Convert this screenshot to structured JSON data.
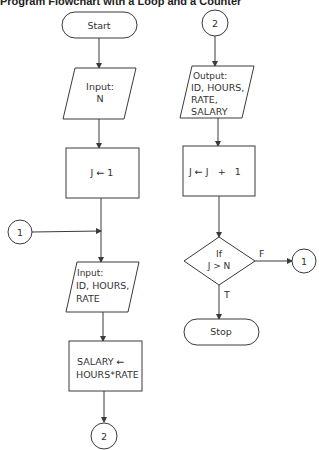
{
  "title": "Program Flowchart with a Loop and a Counter",
  "nodes": {
    "start": {
      "type": "terminal",
      "label": "Start"
    },
    "input_n": {
      "type": "input-output",
      "lines": [
        "Input:",
        "N"
      ]
    },
    "init_counter": {
      "type": "process",
      "lines": [
        "J ← 1"
      ]
    },
    "connector_1_left": {
      "type": "connector",
      "label": "1"
    },
    "input_record": {
      "type": "input-output",
      "lines": [
        "Input:",
        "ID, HOURS,",
        "RATE"
      ]
    },
    "compute_salary": {
      "type": "process",
      "lines": [
        "SALARY ←",
        "HOURS*RATE"
      ]
    },
    "connector_2_bottom": {
      "type": "connector",
      "label": "2"
    },
    "connector_2_top": {
      "type": "connector",
      "label": "2"
    },
    "output_record": {
      "type": "input-output",
      "lines": [
        "Output:",
        "ID, HOURS,",
        "RATE,",
        "SALARY"
      ]
    },
    "increment_counter": {
      "type": "process",
      "lines": [
        "J ← J   +   1"
      ]
    },
    "decision": {
      "type": "decision",
      "lines": [
        "If",
        "J > N"
      ]
    },
    "connector_1_right": {
      "type": "connector",
      "label": "1"
    },
    "stop": {
      "type": "terminal",
      "label": "Stop"
    }
  },
  "edges": {
    "false_label": "F",
    "true_label": "T"
  }
}
